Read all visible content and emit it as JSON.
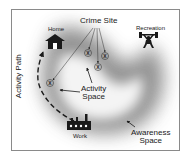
{
  "diagram": {
    "labels": {
      "crime_site": "Crime Site",
      "home": "Home",
      "recreation": "Recreation",
      "activity_path": "Activity Path",
      "activity_space_line1": "Activity",
      "activity_space_line2": "Space",
      "work": "Work",
      "awareness_space_line1": "Awareness",
      "awareness_space_line2": "Space"
    },
    "icons": {
      "home": "house-icon",
      "recreation": "weightlifter-icon",
      "work": "factory-icon",
      "crime_marker": "crime-x-marker-icon"
    },
    "crime_site_count": 4,
    "colors": {
      "frame_border": "#8a8a8a",
      "awareness_shade": "#7a7a7a",
      "icon": "#1a1a1a",
      "background": "#ffffff"
    }
  }
}
